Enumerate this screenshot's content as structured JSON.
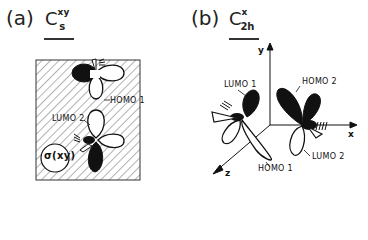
{
  "panel_a": {
    "label": "(a)",
    "symmetry": {
      "base": "C",
      "superscript": "xy",
      "subscript": "s"
    },
    "orbitals": [
      "HOMO 1",
      "LUMO 2"
    ],
    "plane_label": "σ(xy)"
  },
  "panel_b": {
    "label": "(b)",
    "symmetry": {
      "base": "C",
      "superscript": "x",
      "subscript": "2h"
    },
    "orbitals": [
      "LUMO 1",
      "HOMO 2",
      "HOMO 1",
      "LUMO 2"
    ],
    "axes": {
      "x": "x",
      "y": "y",
      "z": "z"
    }
  },
  "colors": {
    "ink": "#111111",
    "hatch": "#555555",
    "background": "#ffffff"
  }
}
